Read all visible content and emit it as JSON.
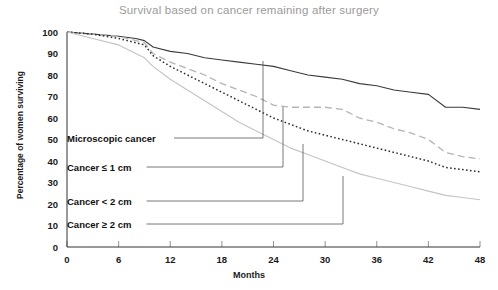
{
  "chart_data": {
    "type": "line",
    "title": "Survival based on cancer remaining after surgery",
    "xlabel": "Months",
    "ylabel": "Percentage of women surviving",
    "xlim": [
      0,
      48
    ],
    "ylim": [
      0,
      100
    ],
    "xticks": [
      "0",
      "6",
      "12",
      "18",
      "24",
      "30",
      "36",
      "42",
      "48"
    ],
    "yticks": [
      "0",
      "10",
      "20",
      "30",
      "40",
      "50",
      "60",
      "70",
      "80",
      "90",
      "100"
    ],
    "grid": false,
    "legend_position": "inline-annotations",
    "series": [
      {
        "name": "Microscopic cancer",
        "style": "solid",
        "color": "#3a3a3a",
        "x": [
          0,
          3,
          6,
          8,
          9,
          10,
          12,
          14,
          16,
          18,
          20,
          22,
          24,
          26,
          28,
          30,
          32,
          34,
          36,
          38,
          40,
          42,
          44,
          46,
          48
        ],
        "y": [
          100,
          99,
          98,
          97,
          96,
          93,
          91,
          90,
          88,
          87,
          86,
          85,
          84,
          82,
          80,
          79,
          78,
          76,
          75,
          73,
          72,
          71,
          65,
          65,
          64
        ]
      },
      {
        "name": "Cancer ≤ 1 cm",
        "style": "dashed",
        "color": "#b4b4b4",
        "x": [
          0,
          3,
          6,
          8,
          9,
          10,
          12,
          14,
          16,
          18,
          20,
          22,
          24,
          26,
          28,
          30,
          32,
          34,
          36,
          38,
          40,
          42,
          44,
          46,
          48
        ],
        "y": [
          100,
          99,
          98,
          96,
          95,
          90,
          86,
          83,
          80,
          76,
          73,
          70,
          66,
          65,
          65,
          65,
          64,
          60,
          58,
          55,
          53,
          50,
          44,
          42,
          41
        ]
      },
      {
        "name": "Cancer < 2 cm",
        "style": "dotted",
        "color": "#2e2e2e",
        "x": [
          0,
          3,
          6,
          8,
          9,
          10,
          12,
          14,
          16,
          18,
          20,
          22,
          24,
          26,
          28,
          30,
          32,
          34,
          36,
          38,
          40,
          42,
          44,
          46,
          48
        ],
        "y": [
          100,
          99,
          97,
          95,
          94,
          89,
          84,
          80,
          76,
          72,
          68,
          64,
          60,
          57,
          54,
          52,
          50,
          48,
          46,
          44,
          42,
          40,
          37,
          36,
          35
        ]
      },
      {
        "name": "Cancer ≥ 2 cm",
        "style": "solid",
        "color": "#c4c4c4",
        "x": [
          0,
          3,
          6,
          8,
          9,
          10,
          12,
          14,
          16,
          18,
          20,
          22,
          24,
          26,
          28,
          30,
          32,
          34,
          36,
          38,
          40,
          42,
          44,
          46,
          48
        ],
        "y": [
          100,
          97,
          94,
          90,
          88,
          84,
          78,
          73,
          68,
          63,
          58,
          54,
          50,
          46,
          43,
          40,
          37,
          34,
          32,
          30,
          28,
          26,
          24,
          23,
          22
        ]
      }
    ],
    "annotations": [
      {
        "label": "Microscopic cancer",
        "text_x": 67,
        "text_y": 138,
        "elbow_x": 263,
        "target_y": 61,
        "series": "Microscopic cancer"
      },
      {
        "label": "Cancer ≤ 1 cm",
        "text_x": 67,
        "text_y": 167,
        "elbow_x": 283,
        "target_y": 107,
        "series": "Cancer ≤ 1 cm"
      },
      {
        "label": "Cancer < 2 cm",
        "text_x": 67,
        "text_y": 201,
        "elbow_x": 303,
        "target_y": 144,
        "series": "Cancer < 2 cm"
      },
      {
        "label": "Cancer ≥ 2 cm",
        "text_x": 67,
        "text_y": 224,
        "elbow_x": 343,
        "target_y": 176,
        "series": "Cancer ≥ 2 cm"
      }
    ]
  }
}
